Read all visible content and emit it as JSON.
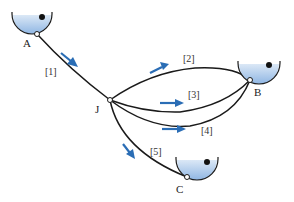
{
  "diagram": {
    "type": "pipe network with reservoirs",
    "colors": {
      "pipe": "#1a1a1a",
      "arrow": "#2a6db5",
      "water_top": "#dbe8f6",
      "water_bottom": "#8fb6e3"
    },
    "reservoirs": [
      {
        "id": "A",
        "label": "A"
      },
      {
        "id": "B",
        "label": "B"
      },
      {
        "id": "C",
        "label": "C"
      }
    ],
    "junction": {
      "id": "J",
      "label": "J"
    },
    "pipes": [
      {
        "id": "1",
        "label": "[1]",
        "from": "A",
        "to": "J"
      },
      {
        "id": "2",
        "label": "[2]",
        "from": "J",
        "to": "B"
      },
      {
        "id": "3",
        "label": "[3]",
        "from": "J",
        "to": "B"
      },
      {
        "id": "4",
        "label": "[4]",
        "from": "J",
        "to": "B"
      },
      {
        "id": "5",
        "label": "[5]",
        "from": "J",
        "to": "C"
      }
    ],
    "flow_arrows": [
      {
        "pipe": "1",
        "direction": "A to J"
      },
      {
        "pipe": "2",
        "direction": "J to B"
      },
      {
        "pipe": "3",
        "direction": "J to B"
      },
      {
        "pipe": "4",
        "direction": "J to B"
      },
      {
        "pipe": "5",
        "direction": "J to C"
      }
    ]
  }
}
